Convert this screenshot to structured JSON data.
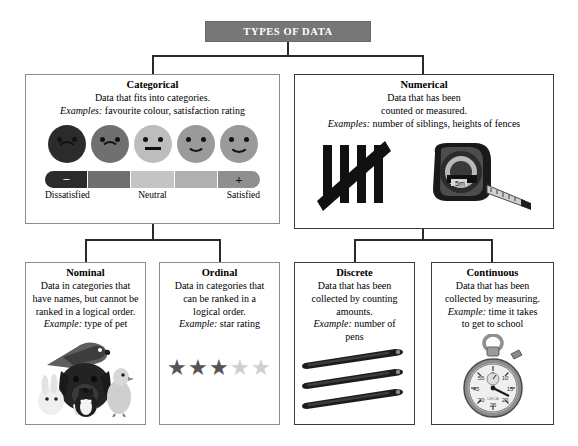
{
  "title": {
    "label": "TYPES OF DATA",
    "bg": "#767676",
    "fg": "#ffffff"
  },
  "boxes": {
    "categorical": {
      "heading": "Categorical",
      "line1": "Data that fits into categories.",
      "examples_label": "Examples:",
      "examples_text": "favourite colour, satisfaction rating",
      "scale": {
        "faces": [
          "very-dissatisfied",
          "dissatisfied",
          "neutral",
          "satisfied",
          "very-satisfied"
        ],
        "face_colors": [
          "#2b2b2b",
          "#707070",
          "#bdbdbd",
          "#9a9a9a",
          "#9a9a9a"
        ],
        "bar_colors": [
          "#2b2b2b",
          "#6f6f6f",
          "#c4c4c4",
          "#b0b0b0",
          "#8f8f8f"
        ],
        "minus": "−",
        "plus": "+",
        "labels": [
          "Dissatisfied",
          "Neutral",
          "Satisfied"
        ]
      }
    },
    "numerical": {
      "heading": "Numerical",
      "line1": "Data that has been",
      "line2": "counted or measured.",
      "examples_label": "Examples:",
      "examples_text": "number of siblings, heights of fences",
      "art": [
        "tally-marks-icon",
        "tape-measure-icon"
      ]
    },
    "nominal": {
      "heading": "Nominal",
      "line1": "Data in categories that",
      "line2": "have names, but cannot be",
      "line3": "ranked in a logical order.",
      "example_label": "Example:",
      "example_text": "type of pet",
      "art": "pets-photo"
    },
    "ordinal": {
      "heading": "Ordinal",
      "line1": "Data in categories that",
      "line2": "can be ranked in a",
      "line3": "logical order.",
      "example_label": "Example:",
      "example_text": "star rating",
      "stars": {
        "filled": 3,
        "total": 5,
        "filled_color": "#555555",
        "empty_color": "#cfcfcf",
        "glyph": "★"
      }
    },
    "discrete": {
      "heading": "Discrete",
      "line1": "Data that has been",
      "line2": "collected by counting",
      "line3": "amounts.",
      "example_label": "Example:",
      "example_text": "number of",
      "example_text2": "pens",
      "art": "pens-photo"
    },
    "continuous": {
      "heading": "Continuous",
      "line1": "Data that has been",
      "line2": "collected by measuring.",
      "example_label": "Example:",
      "example_text": "time it takes",
      "example_text2": "to get to school",
      "art": "stopwatch-photo"
    }
  }
}
